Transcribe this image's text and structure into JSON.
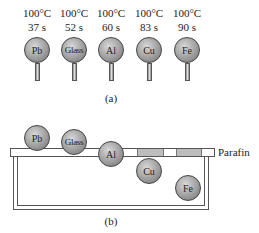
{
  "figure_a": {
    "caption": "(a)",
    "items": [
      {
        "material": "Pb",
        "temperature": "100°C",
        "time": "37 s"
      },
      {
        "material": "Glass",
        "temperature": "100°C",
        "time": "52 s"
      },
      {
        "material": "Al",
        "temperature": "100°C",
        "time": "60 s"
      },
      {
        "material": "Cu",
        "temperature": "100°C",
        "time": "83 s"
      },
      {
        "material": "Fe",
        "temperature": "100°C",
        "time": "90 s"
      }
    ]
  },
  "figure_b": {
    "caption": "(b)",
    "parafin_label": "Parafin",
    "balls": [
      "Pb",
      "Glass",
      "Al",
      "Cu",
      "Fe"
    ]
  },
  "colors": {
    "ball_fill": "#a9a9a9",
    "parafin_melted": "#bdbdbd",
    "line": "#555555"
  }
}
